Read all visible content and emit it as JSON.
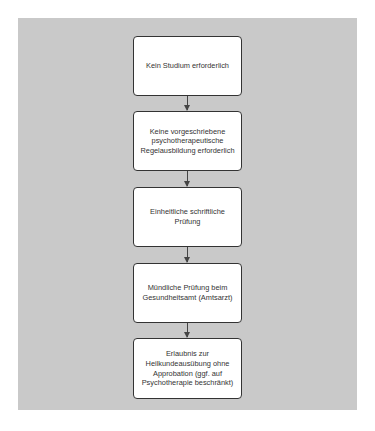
{
  "diagram": {
    "type": "flowchart",
    "direction": "top-to-bottom",
    "nodes": [
      {
        "id": "n1",
        "text": "Kein Studium\nerforderlich"
      },
      {
        "id": "n2",
        "text": "Keine vorgeschriebene psychotherapeutische Regelausbildung erforderlich"
      },
      {
        "id": "n3",
        "text": "Einheitliche schriftliche Prüfung"
      },
      {
        "id": "n4",
        "text": "Mündliche Prüfung beim Gesundheitsamt (Amtsarzt)"
      },
      {
        "id": "n5",
        "text": "Erlaubnis zur Heilkundeausübung ohne Approbation (ggf. auf Psychotherapie beschränkt)"
      }
    ],
    "edges": [
      {
        "from": "n1",
        "to": "n2"
      },
      {
        "from": "n2",
        "to": "n3"
      },
      {
        "from": "n3",
        "to": "n4"
      },
      {
        "from": "n4",
        "to": "n5"
      }
    ],
    "colors": {
      "panel": "#c9c9c9",
      "box": "#ffffff",
      "border": "#333333"
    }
  }
}
